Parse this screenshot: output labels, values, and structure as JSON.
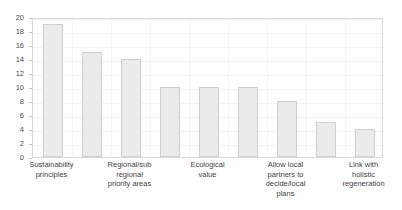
{
  "chart_data": {
    "type": "bar",
    "title": "",
    "xlabel": "",
    "ylabel": "",
    "ylim": [
      0,
      20
    ],
    "ytick_step": 2,
    "yticks": [
      0,
      2,
      4,
      6,
      8,
      10,
      12,
      14,
      16,
      18,
      20
    ],
    "grid": true,
    "legend": false,
    "bar_count": 9,
    "values": [
      19,
      15,
      14,
      10,
      10,
      10,
      8,
      5,
      4
    ],
    "categories": [
      "Sustainability principles",
      "",
      "Regional/sub regional priority areas",
      "",
      "Ecological value",
      "",
      "Allow local partners to decide/local plans",
      "",
      "Link with holistic regeneration"
    ],
    "visible_tick_labels": [
      {
        "slot": 0,
        "lines": [
          "Sustainability",
          "principles"
        ]
      },
      {
        "slot": 2,
        "lines": [
          "Regional/sub",
          "regional",
          "priority areas"
        ]
      },
      {
        "slot": 4,
        "lines": [
          "Ecological",
          "value"
        ]
      },
      {
        "slot": 6,
        "lines": [
          "Allow local",
          "partners to",
          "decide/local",
          "plans"
        ]
      },
      {
        "slot": 8,
        "lines": [
          "Link with",
          "holistic",
          "regeneration"
        ]
      }
    ],
    "colors": {
      "bar_fill": "#ebebeb",
      "bar_border": "#cfcfcf",
      "frame": "#d8d8d8",
      "gridline": "#f2f2f2",
      "text": "#3f3f3f",
      "background": "#ffffff"
    }
  }
}
